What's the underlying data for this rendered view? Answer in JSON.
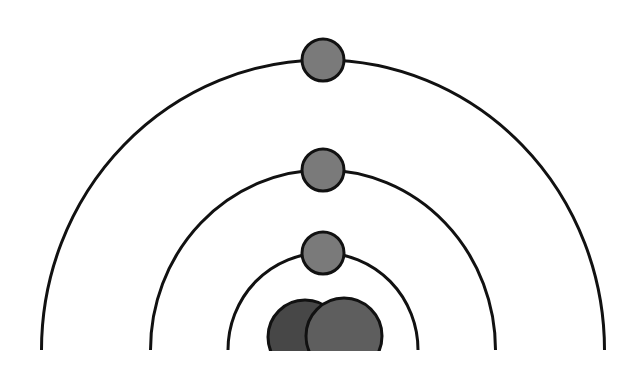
{
  "diagram": {
    "type": "bohr-atom-model",
    "canvas": {
      "width": 644,
      "height": 375,
      "background": "#ffffff"
    },
    "center_x": 323,
    "baseline_y": 350,
    "stroke_color": "#111111",
    "stroke_width": 3,
    "shells": [
      {
        "name": "shell-1",
        "rx": 95,
        "ry": 97
      },
      {
        "name": "shell-2",
        "rx": 172.5,
        "ry": 180
      },
      {
        "name": "shell-3",
        "rx": 281.5,
        "ry": 290
      }
    ],
    "electrons": [
      {
        "name": "electron-shell-1",
        "cx": 323,
        "cy": 253,
        "r": 21,
        "fill": "#7a7a7a"
      },
      {
        "name": "electron-shell-2",
        "cx": 323,
        "cy": 170,
        "r": 21,
        "fill": "#7a7a7a"
      },
      {
        "name": "electron-shell-3",
        "cx": 323,
        "cy": 60,
        "r": 21,
        "fill": "#7a7a7a"
      }
    ],
    "nucleus": [
      {
        "name": "nucleus-particle-left",
        "cx": 305,
        "cy": 337,
        "r": 37,
        "fill": "#474747"
      },
      {
        "name": "nucleus-particle-right",
        "cx": 344,
        "cy": 336,
        "r": 38,
        "fill": "#5e5e5e"
      }
    ],
    "nucleus_clip_y": 351
  }
}
